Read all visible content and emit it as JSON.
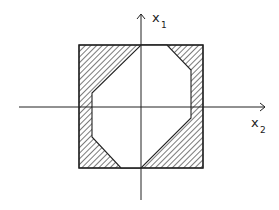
{
  "diagram": {
    "axes": {
      "vertical_label": "x",
      "vertical_subscript": "1",
      "horizontal_label": "x",
      "horizontal_subscript": "2"
    },
    "outer_square": {
      "left": 79,
      "top": 45,
      "right": 203,
      "bottom": 168
    },
    "octagon_points": "141,45 167,45 191,70 191,118 141,168 121,168 92,137 92,93",
    "colors": {
      "stroke": "#222222",
      "hatch": "#333333",
      "background": "#ffffff"
    }
  }
}
